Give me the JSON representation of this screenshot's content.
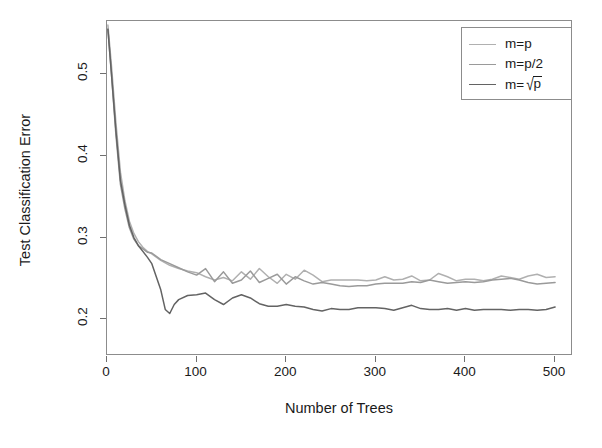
{
  "chart_data": {
    "type": "line",
    "title": "",
    "xlabel": "Number of Trees",
    "ylabel": "Test Classification Error",
    "xlim": [
      0,
      520
    ],
    "ylim": [
      0.155,
      0.565
    ],
    "xticks": [
      0,
      100,
      200,
      300,
      400,
      500
    ],
    "xtick_labels": [
      "0",
      "100",
      "200",
      "300",
      "400",
      "500"
    ],
    "yticks": [
      0.2,
      0.3,
      0.4,
      0.5
    ],
    "ytick_labels": [
      "0.2",
      "0.3",
      "0.4",
      "0.5"
    ],
    "grid": false,
    "legend_position": "top-right",
    "series": [
      {
        "name": "m=p",
        "color": "#b0b0b0",
        "x": [
          1,
          5,
          10,
          15,
          20,
          25,
          30,
          35,
          40,
          45,
          50,
          60,
          70,
          80,
          90,
          100,
          110,
          120,
          130,
          140,
          150,
          160,
          170,
          180,
          190,
          200,
          210,
          220,
          230,
          240,
          250,
          260,
          270,
          280,
          290,
          300,
          310,
          320,
          330,
          340,
          350,
          360,
          370,
          380,
          390,
          400,
          410,
          420,
          430,
          440,
          450,
          460,
          470,
          480,
          490,
          500
        ],
        "values": [
          0.56,
          0.51,
          0.44,
          0.38,
          0.345,
          0.32,
          0.305,
          0.295,
          0.288,
          0.283,
          0.28,
          0.272,
          0.266,
          0.262,
          0.259,
          0.257,
          0.252,
          0.248,
          0.251,
          0.247,
          0.258,
          0.249,
          0.262,
          0.252,
          0.244,
          0.255,
          0.249,
          0.26,
          0.254,
          0.246,
          0.248,
          0.248,
          0.248,
          0.248,
          0.247,
          0.248,
          0.252,
          0.248,
          0.249,
          0.253,
          0.247,
          0.248,
          0.256,
          0.252,
          0.247,
          0.249,
          0.249,
          0.247,
          0.249,
          0.253,
          0.251,
          0.249,
          0.253,
          0.255,
          0.251,
          0.252
        ]
      },
      {
        "name": "m=p/2",
        "color": "#9a9a9a",
        "x": [
          1,
          5,
          10,
          15,
          20,
          25,
          30,
          35,
          40,
          45,
          50,
          60,
          70,
          80,
          90,
          100,
          110,
          120,
          130,
          140,
          150,
          160,
          170,
          180,
          190,
          200,
          210,
          220,
          230,
          240,
          250,
          260,
          270,
          280,
          290,
          300,
          310,
          320,
          330,
          340,
          350,
          360,
          370,
          380,
          390,
          400,
          410,
          420,
          430,
          440,
          450,
          460,
          470,
          480,
          490,
          500
        ],
        "values": [
          0.555,
          0.5,
          0.425,
          0.365,
          0.335,
          0.312,
          0.298,
          0.29,
          0.286,
          0.282,
          0.281,
          0.273,
          0.268,
          0.263,
          0.258,
          0.254,
          0.262,
          0.246,
          0.258,
          0.244,
          0.248,
          0.259,
          0.245,
          0.25,
          0.255,
          0.243,
          0.252,
          0.247,
          0.243,
          0.245,
          0.243,
          0.241,
          0.24,
          0.241,
          0.241,
          0.243,
          0.244,
          0.244,
          0.244,
          0.246,
          0.245,
          0.248,
          0.246,
          0.244,
          0.245,
          0.246,
          0.245,
          0.246,
          0.248,
          0.249,
          0.25,
          0.248,
          0.245,
          0.243,
          0.244,
          0.245
        ]
      },
      {
        "name": "m=sqrt(p)",
        "color": "#636363",
        "x": [
          1,
          5,
          10,
          15,
          20,
          25,
          30,
          35,
          40,
          45,
          50,
          60,
          65,
          70,
          75,
          80,
          90,
          100,
          110,
          120,
          130,
          140,
          150,
          160,
          170,
          180,
          190,
          200,
          210,
          220,
          230,
          240,
          250,
          260,
          270,
          280,
          290,
          300,
          310,
          320,
          330,
          340,
          350,
          360,
          370,
          380,
          390,
          400,
          410,
          420,
          430,
          440,
          450,
          460,
          470,
          480,
          490,
          500
        ],
        "values": [
          0.555,
          0.5,
          0.43,
          0.37,
          0.34,
          0.315,
          0.3,
          0.29,
          0.283,
          0.276,
          0.268,
          0.236,
          0.212,
          0.207,
          0.218,
          0.224,
          0.229,
          0.23,
          0.232,
          0.224,
          0.218,
          0.226,
          0.23,
          0.226,
          0.219,
          0.216,
          0.216,
          0.218,
          0.216,
          0.215,
          0.212,
          0.21,
          0.213,
          0.212,
          0.212,
          0.214,
          0.214,
          0.214,
          0.213,
          0.211,
          0.214,
          0.217,
          0.213,
          0.212,
          0.212,
          0.213,
          0.211,
          0.213,
          0.211,
          0.212,
          0.212,
          0.212,
          0.211,
          0.212,
          0.212,
          0.211,
          0.212,
          0.215
        ]
      }
    ]
  },
  "legend": {
    "entries": [
      {
        "label": "m=p",
        "color": "#b0b0b0"
      },
      {
        "label": "m=p/2",
        "color": "#9a9a9a"
      },
      {
        "label": "m=",
        "color": "#636363",
        "radical": "√",
        "radicand": "p"
      }
    ]
  }
}
